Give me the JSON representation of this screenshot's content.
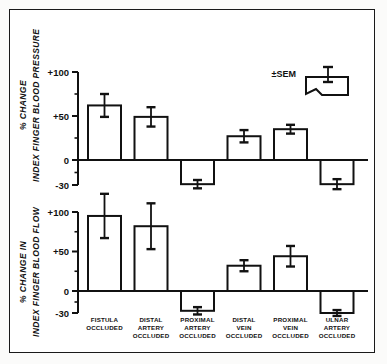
{
  "figure": {
    "background_color": "#ffffff",
    "line_color": "#111111",
    "border": true
  },
  "legend": {
    "label": "±SEM",
    "icon": "bar-with-error-bar-icon",
    "position": "top-right"
  },
  "categories": [
    {
      "lines": [
        "FISTULA",
        "OCCLUDED"
      ]
    },
    {
      "lines": [
        "DISTAL",
        "ARTERY",
        "OCCLUDED"
      ]
    },
    {
      "lines": [
        "PROXIMAL",
        "ARTERY",
        "OCCLUDED"
      ]
    },
    {
      "lines": [
        "DISTAL",
        "VEIN",
        "OCCLUDED"
      ]
    },
    {
      "lines": [
        "PROXIMAL",
        "VEIN",
        "OCCLUDED"
      ]
    },
    {
      "lines": [
        "ULNAR",
        "ARTERY",
        "OCCLUDED"
      ]
    }
  ],
  "chart_data": [
    {
      "type": "bar",
      "panel": "top",
      "title": "",
      "ylabel_line1": "% CHANGE",
      "ylabel_line2": "INDEX FINGER BLOOD PRESSURE",
      "xlabel": "",
      "categories": [
        "FISTULA OCCLUDED",
        "DISTAL ARTERY OCCLUDED",
        "PROXIMAL ARTERY OCCLUDED",
        "DISTAL VEIN OCCLUDED",
        "PROXIMAL VEIN OCCLUDED",
        "ULNAR ARTERY OCCLUDED"
      ],
      "values": [
        62,
        49,
        -29,
        27,
        35,
        -29
      ],
      "errors": [
        13,
        11,
        5,
        7,
        5,
        6
      ],
      "ytick_labels": [
        "+100",
        "+50",
        "0",
        "-30"
      ],
      "ytick_values": [
        100,
        50,
        0,
        -30
      ],
      "minor_ytick_values": [
        75,
        25,
        -15
      ],
      "ylim": [
        -30,
        100
      ],
      "grid": false,
      "legend_position": "top-right"
    },
    {
      "type": "bar",
      "panel": "bottom",
      "title": "",
      "ylabel_line1": "% CHANGE IN",
      "ylabel_line2": "INDEX FINGER BLOOD FLOW",
      "xlabel": "",
      "categories": [
        "FISTULA OCCLUDED",
        "DISTAL ARTERY OCCLUDED",
        "PROXIMAL ARTERY OCCLUDED",
        "DISTAL VEIN OCCLUDED",
        "PROXIMAL VEIN OCCLUDED",
        "ULNAR ARTERY OCCLUDED"
      ],
      "values": [
        95,
        82,
        -27,
        32,
        44,
        -30
      ],
      "errors": [
        28,
        29,
        5,
        7,
        13,
        4
      ],
      "ytick_labels": [
        "+100",
        "+50",
        "0",
        "-30"
      ],
      "ytick_values": [
        100,
        50,
        0,
        -30
      ],
      "minor_ytick_values": [
        75,
        25,
        -15
      ],
      "ylim": [
        -30,
        100
      ],
      "grid": false,
      "legend_position": "none"
    }
  ]
}
